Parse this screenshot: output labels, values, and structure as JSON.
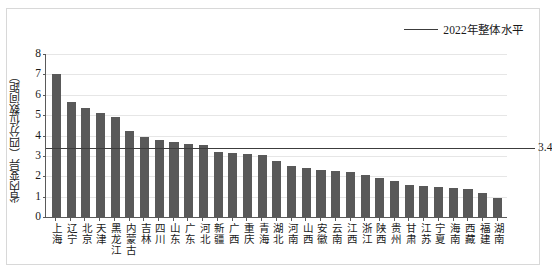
{
  "legend": {
    "label": "2022年整体水平",
    "line_color": "#3c3c3c"
  },
  "axes": {
    "y_title": "省内变异（四分位数间距）",
    "y_ticks": [
      "0",
      "1",
      "2",
      "3",
      "4",
      "5",
      "6",
      "7",
      "8"
    ]
  },
  "reference": {
    "value_label": "3.4",
    "value": 3.4
  },
  "colors": {
    "bar": "#595959",
    "gridline": "#e6e6e6",
    "axis": "#5a5a5a",
    "frame": "#d8d8d8"
  },
  "chart_data": {
    "type": "bar",
    "title": "",
    "xlabel": "",
    "ylabel": "省内变异（四分位数间距）",
    "ylim": [
      0,
      8
    ],
    "yticks": [
      0,
      1,
      2,
      3,
      4,
      5,
      6,
      7,
      8
    ],
    "grid": true,
    "legend_position": "top-right",
    "categories": [
      "上海",
      "辽宁",
      "北京",
      "天津",
      "黑龙江",
      "内蒙古",
      "吉林",
      "四川",
      "山东",
      "广东",
      "河北",
      "新疆",
      "广西",
      "重庆",
      "青海",
      "湖北",
      "河南",
      "山西",
      "安徽",
      "云南",
      "江西",
      "浙江",
      "陕西",
      "贵州",
      "甘肃",
      "江苏",
      "宁夏",
      "海南",
      "西藏",
      "福建",
      "湖南"
    ],
    "values": [
      7.0,
      5.65,
      5.37,
      5.12,
      4.92,
      4.22,
      3.94,
      3.78,
      3.68,
      3.58,
      3.55,
      3.2,
      3.15,
      3.1,
      3.05,
      2.75,
      2.5,
      2.42,
      2.3,
      2.28,
      2.2,
      2.05,
      1.9,
      1.75,
      1.55,
      1.5,
      1.45,
      1.42,
      1.38,
      1.2,
      0.95
    ],
    "series": [
      {
        "name": "省内变异（四分位数间距）",
        "values": [
          7.0,
          5.65,
          5.37,
          5.12,
          4.92,
          4.22,
          3.94,
          3.78,
          3.68,
          3.58,
          3.55,
          3.2,
          3.15,
          3.1,
          3.05,
          2.75,
          2.5,
          2.42,
          2.3,
          2.28,
          2.2,
          2.05,
          1.9,
          1.75,
          1.55,
          1.5,
          1.45,
          1.42,
          1.38,
          1.2,
          0.95
        ]
      }
    ],
    "annotations": [
      {
        "type": "hline",
        "label": "2022年整体水平",
        "value": 3.4,
        "value_label": "3.4"
      }
    ]
  }
}
